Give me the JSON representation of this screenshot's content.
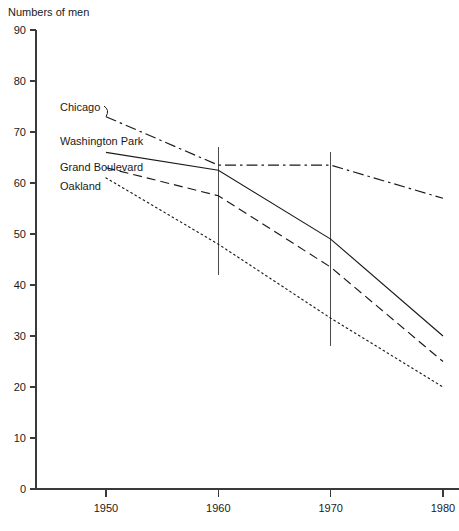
{
  "chart_data": {
    "type": "line",
    "title": "Numbers of men",
    "xlabel": "",
    "ylabel": "Numbers of men",
    "x": [
      1950,
      1960,
      1970,
      1980
    ],
    "xlim": [
      1945,
      1980
    ],
    "ylim": [
      0,
      90
    ],
    "xticks": [
      1950,
      1960,
      1970,
      1980
    ],
    "xticklabels": [
      "1950",
      "1960",
      "1970",
      "1980"
    ],
    "yticks": [
      0,
      10,
      20,
      30,
      40,
      50,
      60,
      70,
      80,
      90
    ],
    "yticklabels": [
      "0",
      "10",
      "20",
      "30",
      "40",
      "50",
      "60",
      "70",
      "80",
      "90"
    ],
    "grid": false,
    "legend_position": "inline-labels-left",
    "series": [
      {
        "name": "Chicago",
        "style": "dash-dot",
        "x": [
          1950,
          1960,
          1970,
          1980
        ],
        "values": [
          73,
          63.5,
          63.5,
          57
        ]
      },
      {
        "name": "Washington Park",
        "style": "solid",
        "x": [
          1950,
          1960,
          1970,
          1980
        ],
        "values": [
          66,
          62.5,
          49,
          30
        ]
      },
      {
        "name": "Grand Boulevard",
        "style": "dashed",
        "x": [
          1950,
          1960,
          1970,
          1980
        ],
        "values": [
          63,
          57.5,
          43.5,
          25
        ]
      },
      {
        "name": "Oakland",
        "style": "dotted",
        "x": [
          1950,
          1960,
          1970,
          1980
        ],
        "values": [
          61,
          48,
          33.5,
          20
        ]
      }
    ],
    "errorbars": [
      {
        "x": 1960,
        "low": 42,
        "high": 67
      },
      {
        "x": 1970,
        "low": 28,
        "high": 66
      }
    ],
    "annotations": [
      {
        "text": "Chicago",
        "x": 1950,
        "y": 73
      },
      {
        "text": "Washington Park",
        "x": 1950,
        "y": 66
      },
      {
        "text": "Grand Boulevard",
        "x": 1950,
        "y": 63
      },
      {
        "text": "Oakland",
        "x": 1950,
        "y": 61
      }
    ]
  },
  "labels": {
    "chicago": "Chicago",
    "washington_park": "Washington Park",
    "grand_boulevard": "Grand Boulevard",
    "oakland": "Oakland"
  },
  "colors": {
    "ink": "#1a1a1a",
    "axis": "#3a3a3a",
    "background": "#ffffff"
  }
}
